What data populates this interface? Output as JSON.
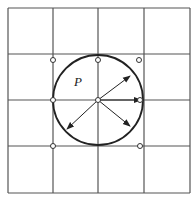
{
  "diagram": {
    "type": "grid-with-circle",
    "grid": {
      "columns": 4,
      "rows": 4,
      "x_lines": [
        8,
        53,
        98,
        144,
        190
      ],
      "y_lines": [
        8,
        54,
        100,
        146,
        193
      ],
      "line_color": "#555555"
    },
    "circle": {
      "label": "P",
      "center": [
        98,
        100
      ],
      "radius": 45,
      "stroke": "#222222"
    },
    "arrows": [
      {
        "name": "arrow-up-right",
        "to": [
          130,
          76
        ]
      },
      {
        "name": "arrow-right",
        "to": [
          141,
          100
        ]
      },
      {
        "name": "arrow-down-right",
        "to": [
          130,
          126
        ]
      },
      {
        "name": "arrow-down-left",
        "to": [
          67,
          129
        ]
      }
    ],
    "open_points": [
      [
        53,
        60
      ],
      [
        98,
        60
      ],
      [
        139,
        60
      ],
      [
        53,
        100
      ],
      [
        98,
        100
      ],
      [
        140,
        100
      ],
      [
        53,
        146
      ],
      [
        140,
        146
      ]
    ]
  }
}
